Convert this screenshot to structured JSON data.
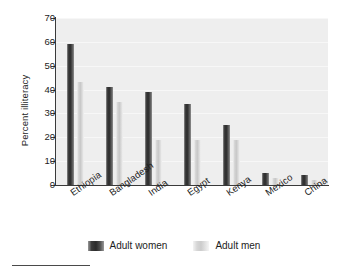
{
  "chart_data": {
    "type": "bar",
    "title": "",
    "xlabel": "",
    "ylabel": "Percent illiteracy",
    "ylim": [
      0,
      70
    ],
    "yticks": [
      0,
      10,
      20,
      30,
      40,
      50,
      60,
      70
    ],
    "grid": true,
    "legend_position": "bottom",
    "categories": [
      "Ethiopia",
      "Bangladesh",
      "India",
      "Egypt",
      "Kenya",
      "Mexico",
      "China"
    ],
    "series": [
      {
        "name": "Adult women",
        "color": "#2b2b2b",
        "values": [
          59,
          41,
          39,
          34,
          25,
          5,
          4
        ]
      },
      {
        "name": "Adult men",
        "color": "#cccccc",
        "values": [
          43,
          35,
          19,
          19,
          19,
          3,
          2
        ]
      }
    ]
  },
  "legend": {
    "items": [
      {
        "label": "Adult women",
        "swatch": "women"
      },
      {
        "label": "Adult men",
        "swatch": "men"
      }
    ]
  }
}
